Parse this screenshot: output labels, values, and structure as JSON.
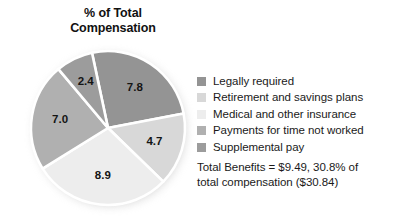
{
  "title": {
    "line1": "% of Total",
    "line2": "Compensation"
  },
  "chart_data": {
    "type": "pie",
    "title": "% of Total Compensation",
    "xlabel": "",
    "ylabel": "",
    "grid": false,
    "legend_position": "right",
    "units": "percent of total compensation",
    "total": 30.8,
    "categories": [
      "Legally required",
      "Retirement and savings plans",
      "Medical and other insurance",
      "Payments for time not worked",
      "Supplemental pay"
    ],
    "values": [
      7.8,
      4.7,
      8.9,
      7.0,
      2.4
    ],
    "colors": [
      "#949494",
      "#d8d8d8",
      "#ededed",
      "#b0b0b0",
      "#9c9c9c"
    ],
    "data_labels": [
      "7.8",
      "4.7",
      "8.9",
      "7.0",
      "2.4"
    ],
    "slices": [
      {
        "label": "Legally required",
        "value": 7.8,
        "data_label": "7.8",
        "color": "#949494"
      },
      {
        "label": "Retirement and savings plans",
        "value": 4.7,
        "data_label": "4.7",
        "color": "#d8d8d8"
      },
      {
        "label": "Medical and other insurance",
        "value": 8.9,
        "data_label": "8.9",
        "color": "#ededed"
      },
      {
        "label": "Payments for time not worked",
        "value": 7.0,
        "data_label": "7.0",
        "color": "#b0b0b0"
      },
      {
        "label": "Supplemental pay",
        "value": 2.4,
        "data_label": "2.4",
        "color": "#9c9c9c"
      }
    ],
    "annotations": [
      "Total Benefits = $9.49, 30.8% of",
      "total compensation ($30.84)"
    ]
  },
  "legend": {
    "items": [
      {
        "label": "Legally required",
        "color": "#949494"
      },
      {
        "label": "Retirement and savings plans",
        "color": "#d8d8d8"
      },
      {
        "label": "Medical and other insurance",
        "color": "#ededed"
      },
      {
        "label": "Payments for time not worked",
        "color": "#b0b0b0"
      },
      {
        "label": "Supplemental pay",
        "color": "#9c9c9c"
      }
    ]
  },
  "footnote": {
    "line1": "Total Benefits = $9.49, 30.8% of",
    "line2": "total compensation ($30.84)"
  }
}
